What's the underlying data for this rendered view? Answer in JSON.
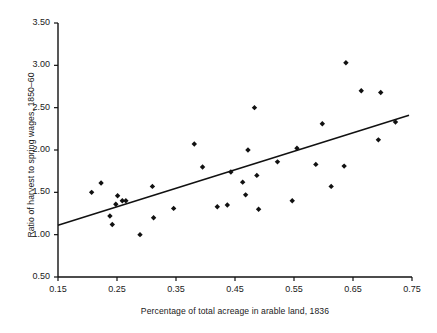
{
  "chart_data": {
    "type": "scatter",
    "title": "",
    "xlabel": "Percentage of total acreage in arable land, 1836",
    "ylabel": "Ratio of harvest to spring wages, 1850–60",
    "xlim": [
      0.15,
      0.75
    ],
    "ylim": [
      0.5,
      3.5
    ],
    "xticks": [
      "0.15",
      "0.25",
      "0.35",
      "0.45",
      "0.55",
      "0.65",
      "0.75"
    ],
    "xtick_values": [
      0.15,
      0.25,
      0.35,
      0.45,
      0.55,
      0.65,
      0.75
    ],
    "yticks": [
      "0.50",
      "1.00",
      "1.50",
      "2.00",
      "2.50",
      "3.00",
      "3.50"
    ],
    "ytick_values": [
      0.5,
      1.0,
      1.5,
      2.0,
      2.5,
      3.0,
      3.5
    ],
    "grid": false,
    "legend": null,
    "marker": "diamond",
    "marker_color": "#111111",
    "line_color": "#111111",
    "axis_color": "#111111",
    "points": [
      {
        "x": 0.207,
        "y": 1.5
      },
      {
        "x": 0.223,
        "y": 1.61
      },
      {
        "x": 0.238,
        "y": 1.22
      },
      {
        "x": 0.242,
        "y": 1.12
      },
      {
        "x": 0.248,
        "y": 1.36
      },
      {
        "x": 0.251,
        "y": 1.46
      },
      {
        "x": 0.259,
        "y": 1.4
      },
      {
        "x": 0.265,
        "y": 1.4
      },
      {
        "x": 0.289,
        "y": 1.0
      },
      {
        "x": 0.31,
        "y": 1.57
      },
      {
        "x": 0.312,
        "y": 1.2
      },
      {
        "x": 0.346,
        "y": 1.31
      },
      {
        "x": 0.381,
        "y": 2.07
      },
      {
        "x": 0.395,
        "y": 1.8
      },
      {
        "x": 0.42,
        "y": 1.33
      },
      {
        "x": 0.437,
        "y": 1.35
      },
      {
        "x": 0.443,
        "y": 1.74
      },
      {
        "x": 0.463,
        "y": 1.62
      },
      {
        "x": 0.468,
        "y": 1.47
      },
      {
        "x": 0.472,
        "y": 2.0
      },
      {
        "x": 0.483,
        "y": 2.5
      },
      {
        "x": 0.487,
        "y": 1.7
      },
      {
        "x": 0.49,
        "y": 1.3
      },
      {
        "x": 0.522,
        "y": 1.86
      },
      {
        "x": 0.547,
        "y": 1.4
      },
      {
        "x": 0.555,
        "y": 2.02
      },
      {
        "x": 0.587,
        "y": 1.83
      },
      {
        "x": 0.598,
        "y": 2.31
      },
      {
        "x": 0.613,
        "y": 1.57
      },
      {
        "x": 0.635,
        "y": 1.81
      },
      {
        "x": 0.638,
        "y": 3.03
      },
      {
        "x": 0.664,
        "y": 2.7
      },
      {
        "x": 0.693,
        "y": 2.12
      },
      {
        "x": 0.697,
        "y": 2.68
      },
      {
        "x": 0.722,
        "y": 2.33
      }
    ],
    "fit_line": {
      "x_start": 0.15,
      "y_start": 1.11,
      "x_end": 0.745,
      "y_end": 2.41
    }
  }
}
